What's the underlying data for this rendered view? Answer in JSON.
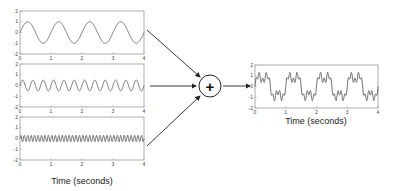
{
  "diagram": {
    "operator_symbol": "+",
    "operator_name": "sum",
    "input_plots": [
      {
        "id": "input-1",
        "frequency_hz": 1,
        "amplitude": 1,
        "xlabel": ""
      },
      {
        "id": "input-2",
        "frequency_hz": 3,
        "amplitude": 0.5,
        "xlabel": ""
      },
      {
        "id": "input-3",
        "frequency_hz": 9,
        "amplitude": 0.3,
        "xlabel": "Time (seconds)"
      }
    ],
    "output_plot": {
      "id": "output",
      "xlabel": "Time (seconds)"
    },
    "axes": {
      "x_ticks": [
        "0",
        "1",
        "2",
        "3",
        "4"
      ],
      "y_ticks": [
        "2",
        "1",
        "0",
        "-1",
        "-2"
      ],
      "xlim": [
        0,
        4
      ],
      "ylim": [
        -2,
        2
      ]
    },
    "colors": {
      "signal": "#707070",
      "box": "#9a9a9a",
      "arrow": "#222222"
    }
  },
  "chart_data": [
    {
      "type": "line",
      "title": "",
      "xlabel": "",
      "ylabel": "",
      "x_range": [
        0,
        4
      ],
      "ylim": [
        -2,
        2
      ],
      "series": [
        {
          "name": "sin(2π·1·t)",
          "frequency": 1,
          "amplitude": 1
        }
      ]
    },
    {
      "type": "line",
      "title": "",
      "xlabel": "",
      "ylabel": "",
      "x_range": [
        0,
        4
      ],
      "ylim": [
        -2,
        2
      ],
      "series": [
        {
          "name": "0.5·sin(2π·3·t)",
          "frequency": 3,
          "amplitude": 0.5
        }
      ]
    },
    {
      "type": "line",
      "title": "",
      "xlabel": "Time (seconds)",
      "ylabel": "",
      "x_range": [
        0,
        4
      ],
      "ylim": [
        -2,
        2
      ],
      "series": [
        {
          "name": "0.3·sin(2π·9·t)",
          "frequency": 9,
          "amplitude": 0.3
        }
      ]
    },
    {
      "type": "line",
      "title": "",
      "xlabel": "Time (seconds)",
      "ylabel": "",
      "x_range": [
        0,
        4
      ],
      "ylim": [
        -2,
        2
      ],
      "series": [
        {
          "name": "sum",
          "components": [
            "1Hz",
            "3Hz",
            "9Hz"
          ]
        }
      ]
    }
  ]
}
